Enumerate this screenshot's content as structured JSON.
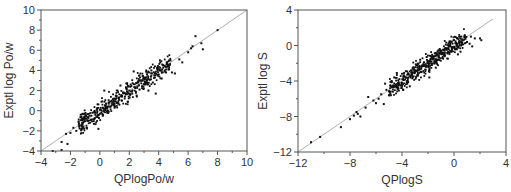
{
  "chart_data": [
    {
      "type": "scatter",
      "title": "",
      "xlabel": "QPlogPo/w",
      "ylabel": "Exptl log Po/w",
      "xlim": [
        -4,
        10
      ],
      "ylim": [
        -4,
        10
      ],
      "xticks": [
        -4,
        -2,
        0,
        2,
        4,
        6,
        8,
        10
      ],
      "yticks": [
        -4,
        -2,
        0,
        2,
        4,
        6,
        8,
        10
      ],
      "xtick_labels": [
        "−4",
        "−2",
        "0",
        "2",
        "4",
        "6",
        "8",
        "10"
      ],
      "ytick_labels": [
        "−4",
        "−2",
        "0",
        "2",
        "4",
        "6",
        "8",
        "10"
      ],
      "grid": false,
      "legend": null,
      "reference_line": {
        "type": "y=x",
        "from": [
          -4,
          -4
        ],
        "to": [
          10,
          10
        ],
        "color": "#9a9a9a"
      },
      "series": [
        {
          "name": "compounds",
          "n_points_approx": 500,
          "trend": "tightly clustered along y=x, dense for x in [-1.5, 5]",
          "points": [
            [
              -3.2,
              -4.0
            ],
            [
              -2.6,
              -3.9
            ],
            [
              -2.6,
              -3.1
            ],
            [
              -2.2,
              -3.3
            ],
            [
              -2.3,
              -2.3
            ],
            [
              -2.0,
              -2.2
            ],
            [
              -1.8,
              -1.7
            ],
            [
              -1.6,
              -2.0
            ],
            [
              -1.4,
              -1.5
            ],
            [
              -1.3,
              -0.4
            ],
            [
              -1.2,
              -1.2
            ],
            [
              -1.0,
              -0.8
            ],
            [
              -0.9,
              -1.7
            ],
            [
              -0.8,
              -1.0
            ],
            [
              -0.7,
              -0.5
            ],
            [
              -0.6,
              -0.9
            ],
            [
              -0.5,
              -0.2
            ],
            [
              -0.4,
              -1.3
            ],
            [
              -0.3,
              -0.4
            ],
            [
              -0.2,
              -0.6
            ],
            [
              -0.1,
              -1.8
            ],
            [
              0.0,
              -0.3
            ],
            [
              0.0,
              0.1
            ],
            [
              0.1,
              -0.2
            ],
            [
              0.2,
              0.3
            ],
            [
              0.2,
              -0.5
            ],
            [
              0.3,
              0.0
            ],
            [
              0.3,
              2.0
            ],
            [
              0.4,
              0.5
            ],
            [
              0.5,
              0.2
            ],
            [
              0.6,
              0.8
            ],
            [
              0.6,
              -0.1
            ],
            [
              0.7,
              0.4
            ],
            [
              0.8,
              1.0
            ],
            [
              0.9,
              0.6
            ],
            [
              1.0,
              1.2
            ],
            [
              1.0,
              0.3
            ],
            [
              1.1,
              1.5
            ],
            [
              1.2,
              0.8
            ],
            [
              1.3,
              1.3
            ],
            [
              1.4,
              2.5
            ],
            [
              1.5,
              1.0
            ],
            [
              1.6,
              1.8
            ],
            [
              1.7,
              1.4
            ],
            [
              1.8,
              2.2
            ],
            [
              1.9,
              0.9
            ],
            [
              2.0,
              2.0
            ],
            [
              2.1,
              2.6
            ],
            [
              2.2,
              1.7
            ],
            [
              2.3,
              3.9
            ],
            [
              2.4,
              2.3
            ],
            [
              2.5,
              1.5
            ],
            [
              2.6,
              2.8
            ],
            [
              2.7,
              2.1
            ],
            [
              2.8,
              3.0
            ],
            [
              2.9,
              2.4
            ],
            [
              3.0,
              3.3
            ],
            [
              3.1,
              2.7
            ],
            [
              3.2,
              3.6
            ],
            [
              3.3,
              2.0
            ],
            [
              3.4,
              3.1
            ],
            [
              3.5,
              4.0
            ],
            [
              3.6,
              2.8
            ],
            [
              3.7,
              3.5
            ],
            [
              3.8,
              1.7
            ],
            [
              3.9,
              4.2
            ],
            [
              4.0,
              3.6
            ],
            [
              4.1,
              4.8
            ],
            [
              4.2,
              3.2
            ],
            [
              4.3,
              4.5
            ],
            [
              4.4,
              4.0
            ],
            [
              4.5,
              3.8
            ],
            [
              4.6,
              4.4
            ],
            [
              4.8,
              5.0
            ],
            [
              4.9,
              3.8
            ],
            [
              5.1,
              3.7
            ],
            [
              5.4,
              5.1
            ],
            [
              5.6,
              4.8
            ],
            [
              6.0,
              5.8
            ],
            [
              6.2,
              6.2
            ],
            [
              6.3,
              6.4
            ],
            [
              6.5,
              7.4
            ],
            [
              6.9,
              6.7
            ],
            [
              7.0,
              6.1
            ],
            [
              8.0,
              8.0
            ]
          ]
        }
      ]
    },
    {
      "type": "scatter",
      "title": "",
      "xlabel": "QPlogS",
      "ylabel": "Exptl log S",
      "xlim": [
        -12,
        4
      ],
      "ylim": [
        -12,
        4
      ],
      "xticks": [
        -12,
        -8,
        -4,
        0,
        4
      ],
      "yticks": [
        -12,
        -8,
        -4,
        0,
        4
      ],
      "xtick_labels": [
        "−12",
        "−8",
        "−4",
        "0",
        "4"
      ],
      "ytick_labels": [
        "−12",
        "−8",
        "−4",
        "0",
        "4"
      ],
      "grid": false,
      "legend": null,
      "reference_line": {
        "type": "y=x",
        "from": [
          -12,
          -12
        ],
        "to": [
          3,
          3
        ],
        "color": "#9a9a9a"
      },
      "series": [
        {
          "name": "compounds",
          "n_points_approx": 500,
          "trend": "tightly clustered along y=x, dense for x in [-5, 1]",
          "points": [
            [
              -11.0,
              -10.9
            ],
            [
              -10.3,
              -10.3
            ],
            [
              -8.7,
              -9.2
            ],
            [
              -8.0,
              -8.3
            ],
            [
              -7.7,
              -7.9
            ],
            [
              -7.5,
              -7.5
            ],
            [
              -7.4,
              -7.7
            ],
            [
              -7.2,
              -8.0
            ],
            [
              -6.8,
              -7.0
            ],
            [
              -6.6,
              -5.8
            ],
            [
              -6.2,
              -6.2
            ],
            [
              -6.0,
              -6.5
            ],
            [
              -5.8,
              -6.0
            ],
            [
              -5.6,
              -5.5
            ],
            [
              -5.4,
              -6.6
            ],
            [
              -5.2,
              -5.0
            ],
            [
              -5.0,
              -5.6
            ],
            [
              -4.9,
              -4.5
            ],
            [
              -4.8,
              -4.0
            ],
            [
              -4.7,
              -5.2
            ],
            [
              -4.5,
              -4.4
            ],
            [
              -4.4,
              -3.1
            ],
            [
              -4.3,
              -4.8
            ],
            [
              -4.2,
              -3.8
            ],
            [
              -4.0,
              -4.2
            ],
            [
              -3.9,
              -5.0
            ],
            [
              -3.8,
              -3.5
            ],
            [
              -3.6,
              -4.0
            ],
            [
              -3.5,
              -3.2
            ],
            [
              -3.4,
              -4.6
            ],
            [
              -3.3,
              -2.8
            ],
            [
              -3.2,
              -3.7
            ],
            [
              -3.0,
              -3.0
            ],
            [
              -2.9,
              -2.2
            ],
            [
              -2.8,
              -3.4
            ],
            [
              -2.7,
              -2.6
            ],
            [
              -2.6,
              -1.6
            ],
            [
              -2.5,
              -3.0
            ],
            [
              -2.4,
              -2.3
            ],
            [
              -2.3,
              -1.9
            ],
            [
              -2.2,
              -2.7
            ],
            [
              -2.0,
              -2.0
            ],
            [
              -1.9,
              -3.6
            ],
            [
              -1.8,
              -1.5
            ],
            [
              -1.7,
              -2.2
            ],
            [
              -1.6,
              -1.2
            ],
            [
              -1.5,
              -1.8
            ],
            [
              -1.4,
              -2.5
            ],
            [
              -1.3,
              -1.0
            ],
            [
              -1.2,
              -1.6
            ],
            [
              -1.0,
              -0.8
            ],
            [
              -0.9,
              -1.4
            ],
            [
              -0.8,
              -0.5
            ],
            [
              -0.7,
              -1.1
            ],
            [
              -0.6,
              -0.3
            ],
            [
              -0.5,
              -0.9
            ],
            [
              -0.4,
              0.0
            ],
            [
              -0.3,
              -0.6
            ],
            [
              -0.2,
              0.4
            ],
            [
              -0.1,
              -0.2
            ],
            [
              0.0,
              0.6
            ],
            [
              0.1,
              -0.4
            ],
            [
              0.2,
              0.2
            ],
            [
              0.3,
              -1.0
            ],
            [
              0.4,
              0.5
            ],
            [
              0.6,
              0.1
            ],
            [
              0.8,
              0.9
            ],
            [
              1.0,
              0.4
            ],
            [
              1.2,
              0.2
            ],
            [
              1.3,
              1.0
            ],
            [
              1.4,
              -0.1
            ],
            [
              1.6,
              0.8
            ],
            [
              2.0,
              0.8
            ],
            [
              2.1,
              0.6
            ],
            [
              -4.6,
              -3.6
            ],
            [
              -3.7,
              -2.9
            ],
            [
              -2.1,
              -1.3
            ],
            [
              -1.1,
              -0.4
            ],
            [
              0.5,
              -0.7
            ],
            [
              -5.3,
              -4.3
            ]
          ]
        }
      ]
    }
  ]
}
